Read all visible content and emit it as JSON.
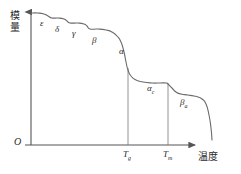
{
  "figure": {
    "axes": {
      "y_label": "模量",
      "y_label_chars": [
        "模",
        "量"
      ],
      "x_label": "温度",
      "origin_label": "O",
      "axis_color": "#555555",
      "curve_color": "#6b6b6b"
    },
    "ticks": [
      {
        "name": "tg",
        "symbol": "T",
        "subscript": "g",
        "x": 128
      },
      {
        "name": "tm",
        "symbol": "T",
        "subscript": "m",
        "x": 168
      }
    ],
    "region_labels": [
      {
        "name": "epsilon",
        "symbol": "ε",
        "subscript": "",
        "x": 40,
        "y": 19
      },
      {
        "name": "delta",
        "symbol": "δ",
        "subscript": "",
        "x": 55,
        "y": 25
      },
      {
        "name": "gamma",
        "symbol": "γ",
        "subscript": "",
        "x": 72,
        "y": 29
      },
      {
        "name": "beta",
        "symbol": "β",
        "subscript": "",
        "x": 92,
        "y": 36
      },
      {
        "name": "alpha",
        "symbol": "α",
        "subscript": "",
        "x": 119,
        "y": 47
      },
      {
        "name": "alpha-c",
        "symbol": "α",
        "subscript": "c",
        "x": 147,
        "y": 84
      },
      {
        "name": "beta-a",
        "symbol": "β",
        "subscript": "a",
        "x": 180,
        "y": 98
      }
    ]
  },
  "chart_data": {
    "type": "line",
    "title": "",
    "xlabel": "温度",
    "ylabel": "模量",
    "xlim": [
      0,
      241
    ],
    "ylim": [
      0,
      174
    ],
    "grid": false,
    "legend": null,
    "annotations": [
      {
        "label": "ε",
        "region": "glassy secondary transition"
      },
      {
        "label": "δ",
        "region": "glassy secondary transition"
      },
      {
        "label": "γ",
        "region": "glassy secondary transition"
      },
      {
        "label": "β",
        "region": "glassy secondary transition"
      },
      {
        "label": "α",
        "region": "glass transition at Tg"
      },
      {
        "label": "α_c",
        "region": "rubbery plateau"
      },
      {
        "label": "β_a",
        "region": "pre-melting region"
      }
    ],
    "x_tick_labels": [
      "T_g",
      "T_m"
    ],
    "x_tick_values": [
      128,
      168
    ],
    "y_tick_labels": [],
    "series": [
      {
        "name": "modulus",
        "points": [
          [
            31,
            13
          ],
          [
            38,
            13
          ],
          [
            44,
            14
          ],
          [
            48,
            16
          ],
          [
            52,
            18
          ],
          [
            58,
            18
          ],
          [
            64,
            19
          ],
          [
            67,
            21
          ],
          [
            70,
            23
          ],
          [
            78,
            23
          ],
          [
            84,
            24
          ],
          [
            87,
            26
          ],
          [
            90,
            29
          ],
          [
            98,
            29
          ],
          [
            106,
            30
          ],
          [
            112,
            32
          ],
          [
            117,
            36
          ],
          [
            121,
            42
          ],
          [
            124,
            52
          ],
          [
            126,
            62
          ],
          [
            128,
            70
          ],
          [
            131,
            76
          ],
          [
            136,
            80
          ],
          [
            143,
            82
          ],
          [
            152,
            83
          ],
          [
            160,
            83
          ],
          [
            166,
            83
          ],
          [
            168,
            84
          ],
          [
            172,
            88
          ],
          [
            176,
            92
          ],
          [
            181,
            94
          ],
          [
            188,
            95
          ],
          [
            194,
            96
          ],
          [
            198,
            97
          ],
          [
            202,
            99
          ],
          [
            206,
            104
          ],
          [
            209,
            115
          ],
          [
            211,
            128
          ],
          [
            212,
            140
          ]
        ]
      }
    ]
  }
}
